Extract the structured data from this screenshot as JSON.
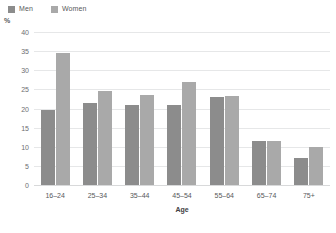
{
  "chart_data": {
    "type": "bar",
    "title": "",
    "subtitle": "",
    "xlabel": "Age",
    "ylabel": "%",
    "unit_label": "%",
    "categories": [
      "16–24",
      "25–34",
      "35–44",
      "45–54",
      "55–64",
      "65–74",
      "75+"
    ],
    "series": [
      {
        "name": "Men",
        "color": "#8c8c8c",
        "values": [
          19.5,
          21.5,
          21.0,
          20.8,
          23.0,
          11.5,
          7.0
        ]
      },
      {
        "name": "Women",
        "color": "#a9a9a9",
        "values": [
          34.6,
          24.5,
          23.5,
          27.0,
          23.2,
          11.6,
          10.0
        ]
      }
    ],
    "ylim": [
      0,
      40
    ],
    "yticks": [
      0,
      5,
      10,
      15,
      20,
      25,
      30,
      35,
      40
    ],
    "grid": true,
    "legend_position": "top-left"
  },
  "legend": {
    "items": [
      {
        "label": "Men"
      },
      {
        "label": "Women"
      }
    ]
  },
  "colors": {
    "men": "#8c8c8c",
    "women": "#a9a9a9",
    "grid": "#e6e7e8",
    "text": "#58595b",
    "background": "#ffffff"
  }
}
